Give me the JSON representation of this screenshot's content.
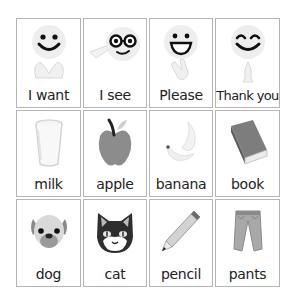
{
  "board": {
    "cards": [
      {
        "label": "I want",
        "icon": "smiley-with-hands-icon"
      },
      {
        "label": "I see",
        "icon": "smiley-with-glasses-pointing-icon"
      },
      {
        "label": "Please",
        "icon": "grinning-face-waving-hand-icon"
      },
      {
        "label": "Thank you",
        "icon": "happy-face-praying-hands-icon"
      },
      {
        "label": "milk",
        "icon": "glass-of-milk-icon"
      },
      {
        "label": "apple",
        "icon": "apple-icon"
      },
      {
        "label": "banana",
        "icon": "banana-icon"
      },
      {
        "label": "book",
        "icon": "book-icon"
      },
      {
        "label": "dog",
        "icon": "dog-face-icon"
      },
      {
        "label": "cat",
        "icon": "cat-face-icon"
      },
      {
        "label": "pencil",
        "icon": "pencil-icon"
      },
      {
        "label": "pants",
        "icon": "pants-icon"
      }
    ]
  }
}
